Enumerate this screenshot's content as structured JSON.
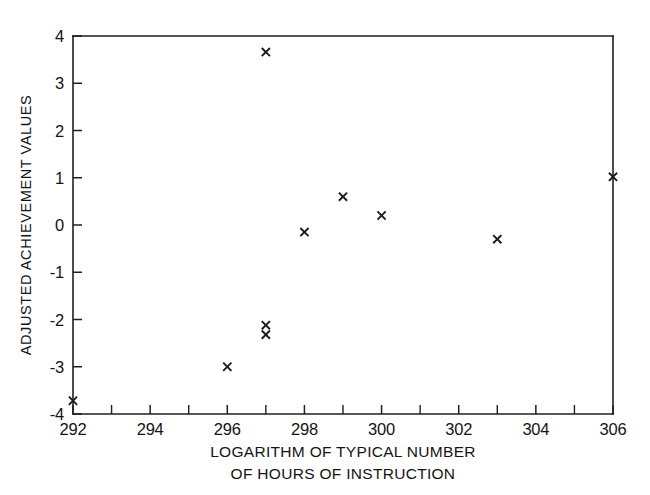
{
  "chart_data": {
    "type": "scatter",
    "title": "",
    "xlabel": "LOGARITHM OF TYPICAL NUMBER OF HOURS OF INSTRUCTION",
    "xlabel_line1": "LOGARITHM OF TYPICAL NUMBER",
    "xlabel_line2": "OF HOURS OF INSTRUCTION",
    "ylabel": "ADJUSTED ACHIEVEMENT VALUES",
    "xlim": [
      292,
      306
    ],
    "ylim": [
      -4,
      4
    ],
    "grid": false,
    "legend": null,
    "marker": "x",
    "marker_color": "#1b1b1b",
    "xticks": [
      292,
      294,
      296,
      298,
      300,
      302,
      304,
      306
    ],
    "xticklabels": [
      "292",
      "294",
      "296",
      "298",
      "300",
      "302",
      "304",
      "306"
    ],
    "xminorticks": [
      293,
      295,
      297,
      299,
      301,
      303,
      305
    ],
    "yticks": [
      -4,
      -3,
      -2,
      -1,
      0,
      1,
      2,
      3,
      4
    ],
    "yticklabels": [
      "-4",
      "-3",
      "-2",
      "-1",
      "0",
      "1",
      "2",
      "3",
      "4"
    ],
    "points": [
      {
        "x": 292,
        "y": -3.72
      },
      {
        "x": 296,
        "y": -3.0
      },
      {
        "x": 297,
        "y": 3.66
      },
      {
        "x": 297,
        "y": -2.12
      },
      {
        "x": 297,
        "y": -2.32
      },
      {
        "x": 298,
        "y": -0.15
      },
      {
        "x": 299,
        "y": 0.6
      },
      {
        "x": 300,
        "y": 0.2
      },
      {
        "x": 303,
        "y": -0.3
      },
      {
        "x": 306,
        "y": 1.02
      }
    ]
  }
}
